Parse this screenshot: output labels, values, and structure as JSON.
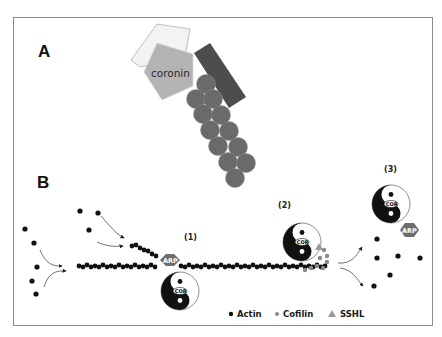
{
  "panels": {
    "a": {
      "label": "A",
      "protein_label": "coronin"
    },
    "b": {
      "label": "B",
      "steps": [
        {
          "label": "(1)"
        },
        {
          "label": "(2)"
        },
        {
          "label": "(3)"
        }
      ],
      "arp_label": "ARP",
      "cor_label": "COR"
    }
  },
  "legend": {
    "items": [
      {
        "label": "Actin",
        "symbol": "black-dot",
        "color": "#111111"
      },
      {
        "label": "Cofilin",
        "symbol": "grey-dot",
        "color": "#8a8a8a"
      },
      {
        "label": "SSHL",
        "symbol": "grey-triangle",
        "color": "#9a9a9a"
      }
    ]
  },
  "colors": {
    "frame": "#8c8c8c",
    "actin_subunit_grey": "#6b6b6b",
    "coronin_pentagon": "#b5b5b5",
    "light_pentagon": "#f2f2f2",
    "dark_rect": "#4a4a4a",
    "arp_hexagon": "#6e6e6e"
  }
}
